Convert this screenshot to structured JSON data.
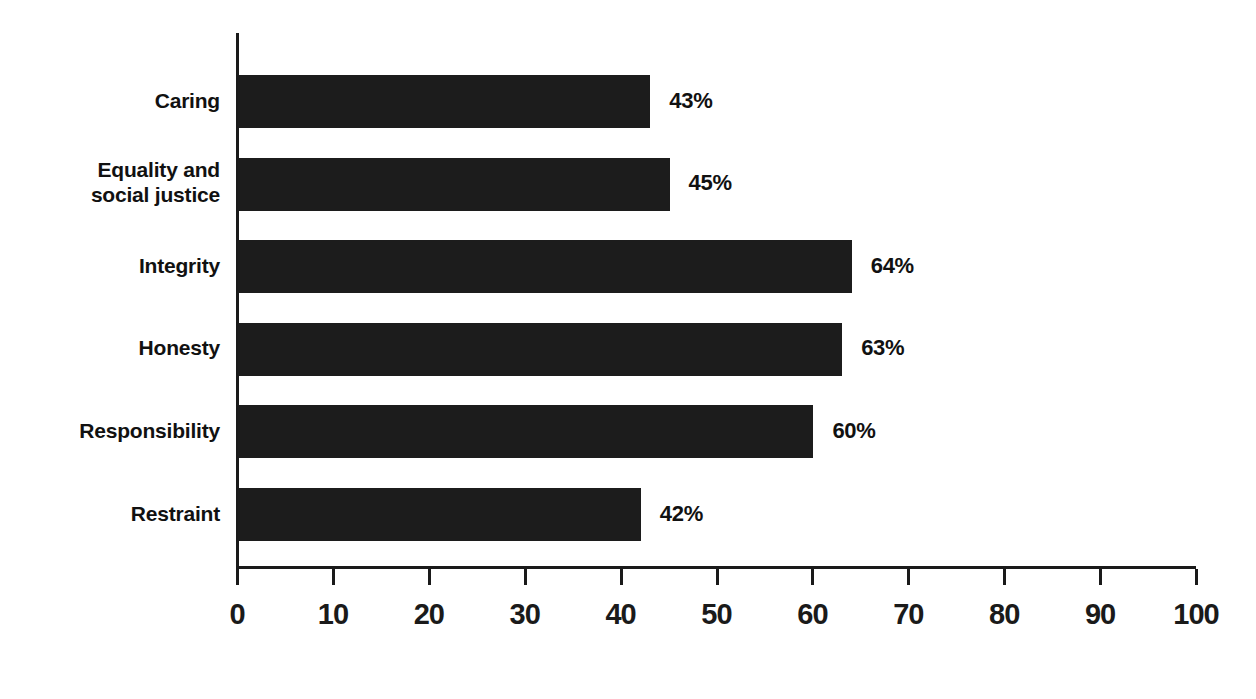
{
  "chart_data": {
    "type": "bar",
    "orientation": "horizontal",
    "title": "",
    "xlabel": "",
    "ylabel": "",
    "xlim": [
      0,
      100
    ],
    "xticks": [
      0,
      10,
      20,
      30,
      40,
      50,
      60,
      70,
      80,
      90,
      100
    ],
    "xtick_labels": [
      "0",
      "10",
      "20",
      "30",
      "40",
      "50",
      "60",
      "70",
      "80",
      "90",
      "100"
    ],
    "grid": false,
    "legend": null,
    "categories": [
      "Caring",
      "Equality and\nsocial justice",
      "Integrity",
      "Honesty",
      "Responsibility",
      "Restraint"
    ],
    "values": [
      43,
      45,
      64,
      63,
      60,
      42
    ],
    "data_labels": [
      "43%",
      "45%",
      "64%",
      "63%",
      "60%",
      "42%"
    ],
    "bar_color": "#1c1c1c",
    "axis_color": "#1a1a1a",
    "background_color": "#ffffff"
  },
  "bars": [
    {
      "label": "Caring",
      "label_line1": "Caring",
      "label_line2": "",
      "value": 43,
      "value_label": "43%"
    },
    {
      "label": "Equality and social justice",
      "label_line1": "Equality and",
      "label_line2": "social justice",
      "value": 45,
      "value_label": "45%"
    },
    {
      "label": "Integrity",
      "label_line1": "Integrity",
      "label_line2": "",
      "value": 64,
      "value_label": "64%"
    },
    {
      "label": "Honesty",
      "label_line1": "Honesty",
      "label_line2": "",
      "value": 63,
      "value_label": "63%"
    },
    {
      "label": "Responsibility",
      "label_line1": "Responsibility",
      "label_line2": "",
      "value": 60,
      "value_label": "60%"
    },
    {
      "label": "Restraint",
      "label_line1": "Restraint",
      "label_line2": "",
      "value": 42,
      "value_label": "42%"
    }
  ],
  "axis": {
    "ticks": [
      "0",
      "10",
      "20",
      "30",
      "40",
      "50",
      "60",
      "70",
      "80",
      "90",
      "100"
    ],
    "min": 0,
    "max": 100
  },
  "title_remnant": ""
}
